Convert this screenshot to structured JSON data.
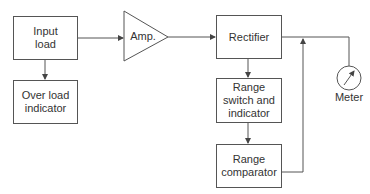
{
  "diagram": {
    "type": "block-diagram",
    "blocks": {
      "input_load": "Input\nload",
      "overload_indicator": "Over load\nindicator",
      "amplifier": "Amp.",
      "rectifier": "Rectifier",
      "range_switch": "Range\nswitch and\nindicator",
      "range_comparator": "Range\ncomparator",
      "meter": "Meter"
    },
    "connections": [
      {
        "from": "Input load",
        "to": "Amp."
      },
      {
        "from": "Input load",
        "to": "Over load indicator"
      },
      {
        "from": "Amp.",
        "to": "Rectifier"
      },
      {
        "from": "Rectifier",
        "to": "Range switch and indicator"
      },
      {
        "from": "Range switch and indicator",
        "to": "Range comparator"
      },
      {
        "from": "Range comparator",
        "to": "Rectifier output line (feedback)"
      },
      {
        "from": "Rectifier",
        "to": "Meter"
      }
    ],
    "colors": {
      "line": "#555555",
      "text": "#333333",
      "background": "#ffffff"
    }
  }
}
